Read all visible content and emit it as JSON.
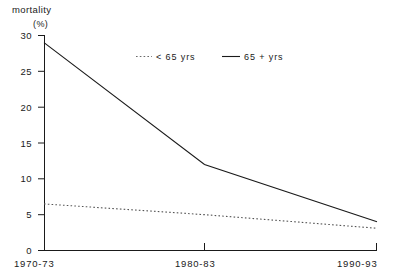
{
  "chart_data": {
    "type": "line",
    "title": "",
    "ylabel": "mortality",
    "yunit": "(%)",
    "xlabel": "",
    "categories": [
      "1970-73",
      "1980-83",
      "1990-93"
    ],
    "yticks": [
      0,
      5,
      10,
      15,
      20,
      25,
      30
    ],
    "ytick_labels": [
      "0",
      "5",
      "10",
      "15",
      "20",
      "25",
      "30"
    ],
    "ylim": [
      0,
      30
    ],
    "grid": false,
    "legend_position": "top-center",
    "series": [
      {
        "name": "< 65 yrs",
        "style": "dotted",
        "color": "#555555",
        "values": [
          6.5,
          5.0,
          3.1
        ]
      },
      {
        "name": "65 + yrs",
        "style": "solid",
        "color": "#1a1a1a",
        "values": [
          29.0,
          12.0,
          4.0
        ]
      }
    ]
  },
  "labels": {
    "axis_title": "mortality",
    "axis_unit": "(%)",
    "y0": "0",
    "y5": "5",
    "y10": "10",
    "y15": "15",
    "y20": "20",
    "y25": "25",
    "y30": "30",
    "x0": "1970-73",
    "x1": "1980-83",
    "x2": "1990-93",
    "legend_under65": "< 65 yrs",
    "legend_over65": "65 + yrs"
  }
}
